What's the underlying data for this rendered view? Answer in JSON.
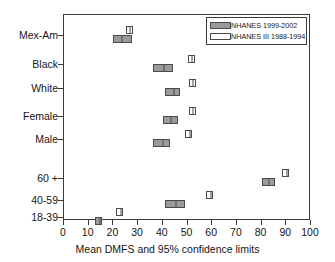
{
  "chart_data": {
    "type": "scatter",
    "title": "",
    "xlabel": "Mean DMFS and 95% confidence limits",
    "ylabel": "",
    "xlim": [
      0,
      100
    ],
    "xticks": [
      0,
      10,
      20,
      30,
      40,
      50,
      60,
      70,
      80,
      90,
      100
    ],
    "xtick_labels": [
      "0",
      "10",
      "20",
      "30",
      "40",
      "50",
      "60",
      "70",
      "80",
      "90",
      "100"
    ],
    "grid": false,
    "legend_position": "top-right",
    "categories": [
      "Mex-Am",
      "Black",
      "White",
      "Female",
      "Male",
      "60 +",
      "40-59",
      "18-39"
    ],
    "series": [
      {
        "name": "NHANES 1999-2002",
        "style": "filled",
        "color": "#9a9a9a",
        "values": [
          23.0,
          40.0,
          44.0,
          43.0,
          39.5,
          82.5,
          45.0,
          14.0
        ],
        "ci_low": [
          20.0,
          36.0,
          41.0,
          40.0,
          36.0,
          80.0,
          41.0,
          13.0
        ],
        "ci_high": [
          27.5,
          44.0,
          47.0,
          46.0,
          43.0,
          85.5,
          49.0,
          15.0
        ]
      },
      {
        "name": "NHANES III 1988-1994",
        "style": "hollow",
        "color": "#ffffff",
        "values": [
          26.5,
          51.5,
          52.0,
          52.0,
          50.5,
          90.0,
          59.0,
          22.5
        ],
        "ci_low": [
          25.5,
          50.5,
          51.0,
          51.0,
          49.5,
          88.5,
          58.0,
          21.5
        ],
        "ci_high": [
          27.5,
          52.5,
          53.0,
          53.0,
          51.5,
          91.0,
          60.0,
          23.5
        ]
      }
    ]
  },
  "legend": {
    "entries": [
      {
        "label": "NHANES 1999-2002",
        "style": "filled"
      },
      {
        "label": "NHANES III 1988-1994",
        "style": "hollow"
      }
    ]
  },
  "axis": {
    "x_title": "Mean DMFS and 95% confidence limits"
  }
}
